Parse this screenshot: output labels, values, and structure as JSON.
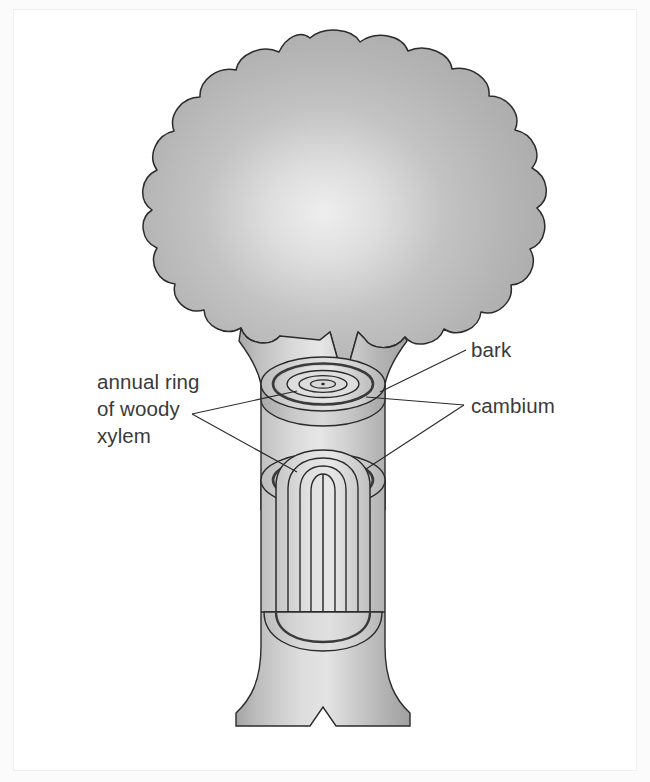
{
  "figure": {
    "background_color": "#ffffff",
    "panel_color": "#ffffff",
    "outline_color": "#2b2b2b",
    "text_color": "#3a3a3a"
  },
  "labels": {
    "bark": "bark",
    "cambium": "cambium",
    "annual_ring_line1": "annual ring",
    "annual_ring_line2": "of woody",
    "annual_ring_line3": "xylem"
  },
  "parts": {
    "canopy_name": "tree canopy",
    "trunk_name": "tree trunk",
    "upper_stump_name": "upper cut stump with growth rings",
    "lower_section_name": "lower trunk cutaway section",
    "base_name": "flared trunk base"
  },
  "colors": {
    "canopy_light": "#e8e8e8",
    "canopy_mid": "#b9b9b9",
    "canopy_dark": "#a8a8a8",
    "trunk_light": "#e2e2e2",
    "trunk_mid": "#c4c4c4",
    "trunk_dark": "#a9a9a9",
    "bark_fill": "#c9c9c9",
    "cambium_fill": "#8f8f8f",
    "xylem_fill": "#dcdcdc",
    "core_fill": "#d2d2d2",
    "outline": "#2b2b2b"
  },
  "rings": {
    "count": 4,
    "description": "concentric annual rings of woody xylem seen on cut face"
  }
}
